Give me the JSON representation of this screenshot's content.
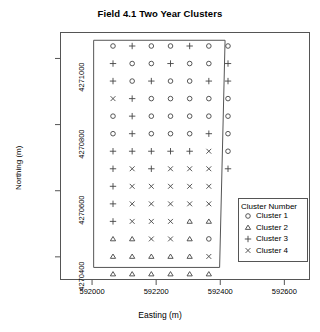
{
  "chart_data": {
    "type": "scatter",
    "title": "Field 4.1 Two Year Clusters",
    "xlabel": "Easting (m)",
    "ylabel": "Northing (m)",
    "xlim": [
      591900,
      592680
    ],
    "ylim": [
      4270330,
      4271080
    ],
    "xticks": [
      592000,
      592200,
      592400,
      592600
    ],
    "yticks": [
      4270400,
      4270600,
      4270800,
      4271000
    ],
    "grid": false,
    "legend_position": "bottom-right",
    "legend_title": "Cluster Number",
    "series": [
      {
        "name": "Cluster 1",
        "symbol": "circle"
      },
      {
        "name": "Cluster 2",
        "symbol": "triangle"
      },
      {
        "name": "Cluster 3",
        "symbol": "plus"
      },
      {
        "name": "Cluster 4",
        "symbol": "cross"
      }
    ],
    "field_boundary": [
      [
        592005,
        4271055
      ],
      [
        592415,
        4271055
      ],
      [
        592398,
        4270368
      ],
      [
        592005,
        4270368
      ]
    ],
    "grid_rows": 14,
    "grid_cols": 7,
    "point_grid": [
      [
        "circle",
        "plus",
        "circle",
        "circle",
        "plus",
        "circle",
        "circle"
      ],
      [
        "plus",
        "circle",
        "circle",
        "plus",
        "circle",
        "circle",
        "plus"
      ],
      [
        "plus",
        "circle",
        "plus",
        "circle",
        "circle",
        "plus",
        "plus"
      ],
      [
        "cross",
        "plus",
        "circle",
        "circle",
        "circle",
        "circle",
        "circle"
      ],
      [
        "circle",
        "plus",
        "circle",
        "circle",
        "circle",
        "circle",
        "circle"
      ],
      [
        "circle",
        "plus",
        "circle",
        "circle",
        "circle",
        "plus",
        "circle"
      ],
      [
        "plus",
        "plus",
        "plus",
        "plus",
        "plus",
        "cross",
        "circle"
      ],
      [
        "plus",
        "cross",
        "plus",
        "cross",
        "cross",
        "cross",
        "plus"
      ],
      [
        "plus",
        "cross",
        "cross",
        "cross",
        "cross",
        "cross",
        null
      ],
      [
        "plus",
        "cross",
        "cross",
        "cross",
        "cross",
        "cross",
        null
      ],
      [
        "plus",
        "cross",
        "cross",
        "cross",
        "triangle",
        "triangle",
        null
      ],
      [
        "triangle",
        "triangle",
        "cross",
        "cross",
        "triangle",
        "circle",
        null
      ],
      [
        "triangle",
        "triangle",
        "triangle",
        "triangle",
        "triangle",
        "cross",
        null
      ],
      [
        "triangle",
        "triangle",
        "triangle",
        "triangle",
        "triangle",
        "triangle",
        null
      ]
    ]
  }
}
